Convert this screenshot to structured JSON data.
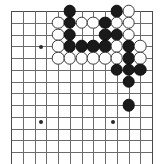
{
  "app": {
    "title": "Go Board Diagram",
    "description": "A cropped go board position diagram showing black and white stones in the upper right area"
  },
  "board": {
    "type": "go-board",
    "columns": 13,
    "rows": 13,
    "origin_x": 11,
    "origin_y": 11,
    "spacing": 11.75,
    "line_color": "#6b6b6b",
    "edge_color": "#4a4a4a",
    "background_color": "#ffffff",
    "black_color": "#1a1a1a",
    "white_color": "#fdfdfd",
    "stone_diameter": 12.6,
    "star_points": [
      {
        "col": 2.55,
        "row": 9.45
      },
      {
        "col": 2.55,
        "row": 3.06
      },
      {
        "col": 8.68,
        "row": 9.45
      }
    ],
    "stones": [
      {
        "col": 5,
        "row": 0,
        "color": "black"
      },
      {
        "col": 9,
        "row": 0,
        "color": "black"
      },
      {
        "col": 10,
        "row": 0,
        "color": "white"
      },
      {
        "col": 4,
        "row": 1,
        "color": "white"
      },
      {
        "col": 5,
        "row": 1,
        "color": "black"
      },
      {
        "col": 6,
        "row": 1,
        "color": "white"
      },
      {
        "col": 7,
        "row": 1,
        "color": "white"
      },
      {
        "col": 8,
        "row": 1,
        "color": "black"
      },
      {
        "col": 9,
        "row": 1,
        "color": "white"
      },
      {
        "col": 10,
        "row": 1,
        "color": "white"
      },
      {
        "col": 4,
        "row": 2,
        "color": "white"
      },
      {
        "col": 5,
        "row": 2,
        "color": "black"
      },
      {
        "col": 8,
        "row": 2,
        "color": "black"
      },
      {
        "col": 9,
        "row": 2,
        "color": "black"
      },
      {
        "col": 10,
        "row": 2,
        "color": "white"
      },
      {
        "col": 4,
        "row": 3,
        "color": "white"
      },
      {
        "col": 5,
        "row": 3,
        "color": "black"
      },
      {
        "col": 6,
        "row": 3,
        "color": "black"
      },
      {
        "col": 7,
        "row": 3,
        "color": "black"
      },
      {
        "col": 8,
        "row": 3,
        "color": "black"
      },
      {
        "col": 9,
        "row": 3,
        "color": "white"
      },
      {
        "col": 10,
        "row": 3,
        "color": "black"
      },
      {
        "col": 11,
        "row": 3,
        "color": "white"
      },
      {
        "col": 4,
        "row": 4,
        "color": "white"
      },
      {
        "col": 5,
        "row": 4,
        "color": "white"
      },
      {
        "col": 6,
        "row": 4,
        "color": "white"
      },
      {
        "col": 7,
        "row": 4,
        "color": "white"
      },
      {
        "col": 8,
        "row": 4,
        "color": "white"
      },
      {
        "col": 9,
        "row": 4,
        "color": "white"
      },
      {
        "col": 10,
        "row": 4,
        "color": "black"
      },
      {
        "col": 11,
        "row": 4,
        "color": "white"
      },
      {
        "col": 9,
        "row": 5,
        "color": "black"
      },
      {
        "col": 10,
        "row": 5,
        "color": "black"
      },
      {
        "col": 11,
        "row": 5,
        "color": "black"
      },
      {
        "col": 10,
        "row": 6,
        "color": "black"
      },
      {
        "col": 10,
        "row": 8,
        "color": "black"
      }
    ]
  }
}
